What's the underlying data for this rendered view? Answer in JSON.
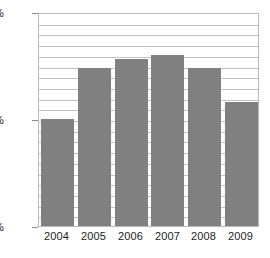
{
  "chart_data": {
    "type": "bar",
    "title": "",
    "xlabel": "",
    "ylabel": "",
    "categories": [
      "2004",
      "2005",
      "2006",
      "2007",
      "2008",
      "2009"
    ],
    "values": [
      60.0,
      62.4,
      62.8,
      63.0,
      62.4,
      60.8
    ],
    "value_labels": [
      "",
      "",
      "",
      "",
      "",
      ""
    ],
    "ylim": [
      55,
      65
    ],
    "y_tick_labels": [
      "65%",
      "60%",
      "55%"
    ],
    "y_tick_values": [
      65,
      60,
      55
    ],
    "gridlines": [
      64.5,
      64.0,
      63.5,
      63.0,
      62.5,
      62.0,
      61.5,
      61.0,
      60.5,
      60.0,
      59.5,
      59.0,
      58.5,
      58.0,
      57.5,
      57.0,
      56.5,
      56.0,
      55.5
    ],
    "grid": true,
    "legend": [],
    "legend_position": "none",
    "units": "percent",
    "bar_color": "#808080",
    "gridline_color": "#c2c2c2",
    "frame_color": "#b9b9b9",
    "background_color": "#ffffff",
    "text_color": "#222222"
  }
}
